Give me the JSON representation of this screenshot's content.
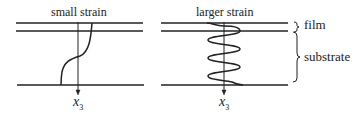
{
  "figure": {
    "panels": [
      {
        "id": "small",
        "title": "small strain",
        "axis_label": "x",
        "axis_subscript": "3",
        "curve": "single S-shaped kink"
      },
      {
        "id": "large",
        "title": "larger strain",
        "axis_label": "x",
        "axis_subscript": "3",
        "curve": "oscillating wave"
      }
    ],
    "annotations": {
      "film": "film",
      "substrate": "substrate"
    },
    "colors": {
      "line": "#222222",
      "background": "#ffffff"
    }
  }
}
